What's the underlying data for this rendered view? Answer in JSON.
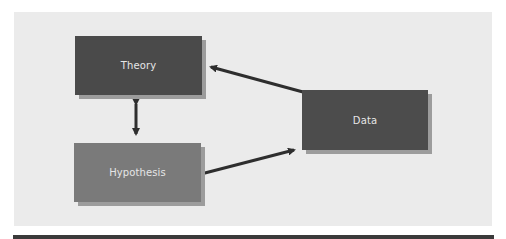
{
  "diagram": {
    "nodes": [
      {
        "id": "theory",
        "label": "Theory",
        "color": "#4a4a4a"
      },
      {
        "id": "hypothesis",
        "label": "Hypothesis",
        "color": "#7a7a7a"
      },
      {
        "id": "data",
        "label": "Data",
        "color": "#4c4c4c"
      }
    ],
    "edges": [
      {
        "from": "theory",
        "to": "hypothesis",
        "type": "bidirectional"
      },
      {
        "from": "hypothesis",
        "to": "data",
        "type": "directed"
      },
      {
        "from": "data",
        "to": "theory",
        "type": "directed"
      }
    ],
    "colors": {
      "panel_background": "#ebebeb",
      "arrow": "#2e2e2e",
      "shadow": "#9c9c9c",
      "label_text": "#e6e6e6"
    }
  }
}
